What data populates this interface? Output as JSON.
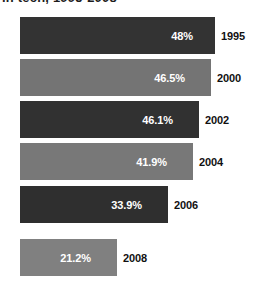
{
  "title": {
    "text": "in tech, 1995-2008",
    "note": "clipped-at-top"
  },
  "chart_data": {
    "type": "bar",
    "orientation": "horizontal",
    "title": "in tech, 1995-2008",
    "xlabel": "",
    "ylabel": "",
    "categories": [
      "1995",
      "2000",
      "2002",
      "2004",
      "2006",
      "2008"
    ],
    "values": [
      48,
      46.5,
      46.1,
      41.9,
      33.9,
      21.2
    ],
    "value_labels": [
      "48%",
      "46.5%",
      "46.1%",
      "41.9%",
      "33.9%",
      "21.2%"
    ],
    "bar_colors": [
      "#333333",
      "#747474",
      "#313131",
      "#787878",
      "#2f2f2f",
      "#808080"
    ],
    "value_label_color": "#ffffff",
    "category_label_color": "#111111",
    "xlim": [
      0,
      48
    ],
    "grid": false,
    "legend": false,
    "background": "#ffffff"
  },
  "bars": [
    {
      "year": "1995",
      "value_label": "48%",
      "color": "#333333",
      "top": 17,
      "height": 37,
      "width": 195,
      "value_right": 22,
      "year_left": 221
    },
    {
      "year": "2000",
      "value_label": "46.5%",
      "color": "#747474",
      "top": 59,
      "height": 37,
      "width": 191,
      "value_right": 26,
      "year_left": 217
    },
    {
      "year": "2002",
      "value_label": "46.1%",
      "color": "#313131",
      "top": 101,
      "height": 37,
      "width": 179,
      "value_right": 26,
      "year_left": 205
    },
    {
      "year": "2004",
      "value_label": "41.9%",
      "color": "#787878",
      "top": 143,
      "height": 37,
      "width": 173,
      "value_right": 26,
      "year_left": 199
    },
    {
      "year": "2006",
      "value_label": "33.9%",
      "color": "#2f2f2f",
      "top": 186,
      "height": 37,
      "width": 148,
      "value_right": 26,
      "year_left": 174
    },
    {
      "year": "2008",
      "value_label": "21.2%",
      "color": "#808080",
      "top": 239,
      "height": 37,
      "width": 97,
      "value_right": 26,
      "year_left": 123
    }
  ]
}
